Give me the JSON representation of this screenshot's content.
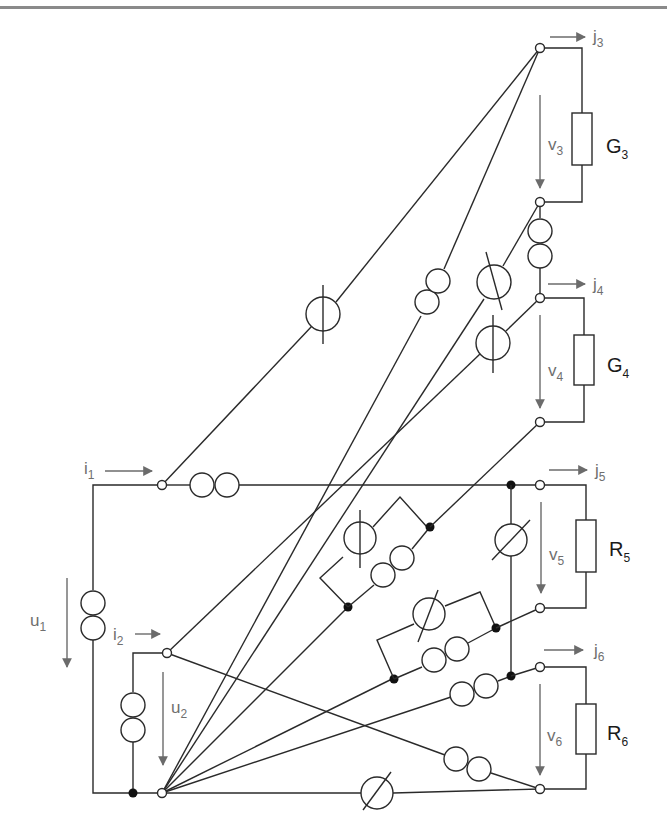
{
  "figure": {
    "type": "electrical network diagram",
    "colors": {
      "wire": "#2a2a2a",
      "label": "#6f6f6f",
      "element_label": "#1a1a1a",
      "top_rule": "#8a8a8a"
    }
  },
  "port_labels": {
    "i1": {
      "base": "i",
      "sub": "1"
    },
    "i2": {
      "base": "i",
      "sub": "2"
    },
    "u1": {
      "base": "u",
      "sub": "1"
    },
    "u2": {
      "base": "u",
      "sub": "2"
    },
    "j3": {
      "base": "j",
      "sub": "3"
    },
    "j4": {
      "base": "j",
      "sub": "4"
    },
    "j5": {
      "base": "j",
      "sub": "5"
    },
    "j6": {
      "base": "j",
      "sub": "6"
    },
    "v3": {
      "base": "v",
      "sub": "3"
    },
    "v4": {
      "base": "v",
      "sub": "4"
    },
    "v5": {
      "base": "v",
      "sub": "5"
    },
    "v6": {
      "base": "v",
      "sub": "6"
    }
  },
  "elements": {
    "G3": {
      "base": "G",
      "sub": "3",
      "kind": "conductance"
    },
    "G4": {
      "base": "G",
      "sub": "4",
      "kind": "conductance"
    },
    "R5": {
      "base": "R",
      "sub": "5",
      "kind": "resistance"
    },
    "R6": {
      "base": "R",
      "sub": "6",
      "kind": "resistance"
    }
  },
  "symbol_legend": [
    {
      "name": "nullator-like source (circle with vertical bar)",
      "icon": "circle-vertical-bar"
    },
    {
      "name": "controlled source (circle with slash)",
      "icon": "circle-slash"
    },
    {
      "name": "double circle (transformer / coupling)",
      "icon": "double-circle"
    },
    {
      "name": "resistor",
      "icon": "rectangle"
    }
  ]
}
